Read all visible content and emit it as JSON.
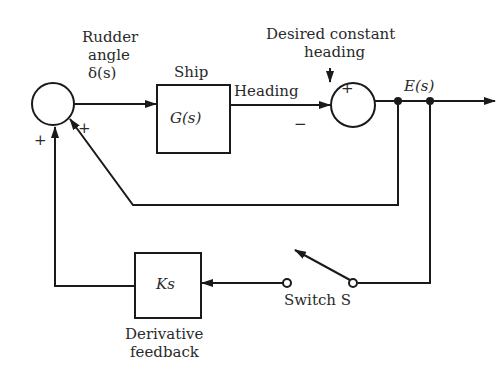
{
  "labels": {
    "rudder_line1": "Rudder",
    "rudder_line2": "angle",
    "rudder_line3": "δ(s)",
    "ship": "Ship",
    "plant": "G(s)",
    "heading": "Heading",
    "desired_line1": "Desired constant",
    "desired_line2": "heading",
    "error": "E(s)",
    "controller": "Ks",
    "derivative_line1": "Derivative",
    "derivative_line2": "feedback",
    "switch": "Switch S"
  },
  "signs": {
    "left_summer_bottom": "+",
    "left_summer_right": "+",
    "right_summer_top": "+",
    "right_summer_left": "−"
  },
  "colors": {
    "line": "#1a1a1a",
    "background": "#ffffff"
  }
}
